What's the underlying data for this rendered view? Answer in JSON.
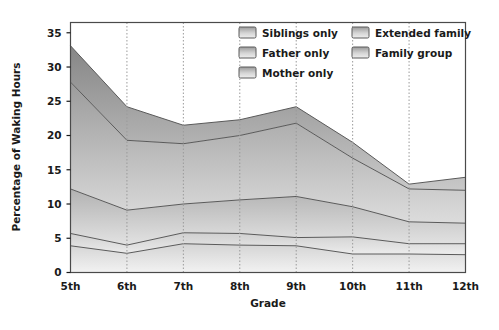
{
  "chart_data": {
    "type": "area",
    "stacked": true,
    "title": "",
    "xlabel": "Grade",
    "ylabel": "Percentage of Waking Hours",
    "categories": [
      "5th",
      "6th",
      "7th",
      "8th",
      "9th",
      "10th",
      "11th",
      "12th"
    ],
    "ylim": [
      0,
      36.5
    ],
    "yticks": [
      0,
      5,
      10,
      15,
      20,
      25,
      30,
      35
    ],
    "ytick_labels": [
      "0",
      "5",
      "10",
      "15",
      "20",
      "25",
      "30",
      "35"
    ],
    "grid": "vertical-dotted",
    "legend_position": "top-right-inside",
    "series": [
      {
        "name": "Mother only",
        "values": [
          3.9,
          2.8,
          4.2,
          4.0,
          3.9,
          2.7,
          2.7,
          2.6
        ],
        "color": "#e8e8e8"
      },
      {
        "name": "Father only",
        "values": [
          1.8,
          1.2,
          1.6,
          1.7,
          1.2,
          2.5,
          1.5,
          1.6
        ],
        "color": "#dcdcdc"
      },
      {
        "name": "Siblings only",
        "values": [
          6.5,
          5.1,
          4.2,
          4.9,
          6.0,
          4.4,
          3.2,
          3.0
        ],
        "color": "#c4c4c4"
      },
      {
        "name": "Extended family",
        "values": [
          15.6,
          10.2,
          8.8,
          9.4,
          10.7,
          7.1,
          4.8,
          4.8
        ],
        "color": "#aaaaaa"
      },
      {
        "name": "Family group",
        "values": [
          5.3,
          4.9,
          2.7,
          2.3,
          2.4,
          2.3,
          0.7,
          1.9
        ],
        "color": "#8f8f8f"
      }
    ],
    "cumulative": [
      {
        "name": "Mother only",
        "values": [
          3.9,
          2.8,
          4.2,
          4.0,
          3.9,
          2.7,
          2.7,
          2.6
        ]
      },
      {
        "name": "Father only",
        "values": [
          5.7,
          4.0,
          5.8,
          5.7,
          5.1,
          5.2,
          4.2,
          4.2
        ]
      },
      {
        "name": "Siblings only",
        "values": [
          12.2,
          9.1,
          10.0,
          10.6,
          11.1,
          9.6,
          7.4,
          7.2
        ]
      },
      {
        "name": "Extended family",
        "values": [
          27.8,
          19.3,
          18.8,
          20.0,
          21.8,
          16.7,
          12.2,
          12.0
        ]
      },
      {
        "name": "Family group",
        "values": [
          33.1,
          24.2,
          21.5,
          22.3,
          24.2,
          19.0,
          12.9,
          13.9
        ]
      }
    ]
  },
  "legend": {
    "column1": [
      {
        "label": "Siblings only"
      },
      {
        "label": "Father only"
      },
      {
        "label": "Mother only"
      }
    ],
    "column2": [
      {
        "label": "Extended family"
      },
      {
        "label": "Family group"
      }
    ]
  },
  "colors": {
    "plot_border": "#4a4a4a",
    "grid_line": "#9a9a9a",
    "text": "#1a1a1a",
    "band_outline": "#5a5a5a",
    "background": "#ffffff"
  }
}
